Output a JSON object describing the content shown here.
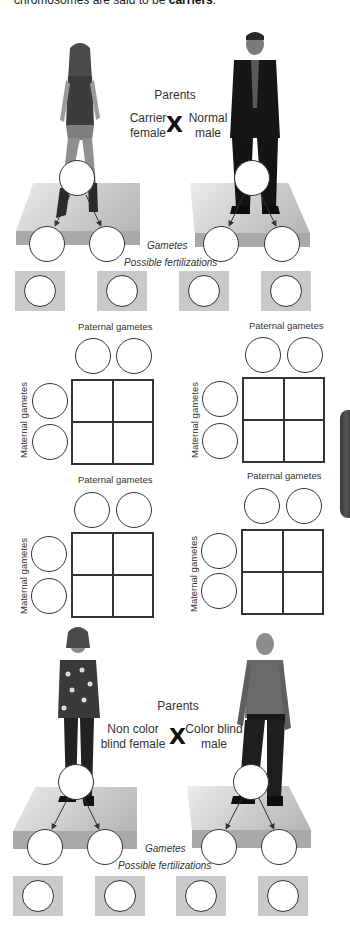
{
  "intro_text": {
    "prefix": "chromosomes are said to be ",
    "bold": "carriers",
    "suffix": "."
  },
  "cross1": {
    "parents_label": "Parents",
    "female_label_line1": "Carrier",
    "female_label_line2": "female",
    "cross_symbol": "X",
    "male_label_line1": "Normal",
    "male_label_line2": "male",
    "gametes_label": "Gametes",
    "fertilizations_label": "Possible fertilizations",
    "female_figure": "woman-in-tank-top-and-jeans",
    "male_figure": "man-in-dark-suit"
  },
  "punnett_squares": [
    {
      "paternal_label": "Paternal gametes",
      "maternal_label": "Maternal gametes"
    },
    {
      "paternal_label": "Paternal gametes",
      "maternal_label": "Maternal gametes"
    },
    {
      "paternal_label": "Paternal gametes",
      "maternal_label": "Maternal gametes"
    },
    {
      "paternal_label": "Paternal gametes",
      "maternal_label": "Maternal gametes"
    }
  ],
  "cross2": {
    "parents_label": "Parents",
    "female_label_line1": "Non color",
    "female_label_line2": "blind female",
    "cross_symbol": "X",
    "male_label_line1": "Color blind",
    "male_label_line2": "male",
    "gametes_label": "Gametes",
    "fertilizations_label": "Possible fertilizations",
    "female_figure": "woman-in-patterned-blouse",
    "male_figure": "man-in-shirt-and-slacks"
  },
  "colors": {
    "platform": "#c0c0c0",
    "fert_box": "#c9c9c9",
    "side_tab": "#444444",
    "text": "#333333"
  }
}
